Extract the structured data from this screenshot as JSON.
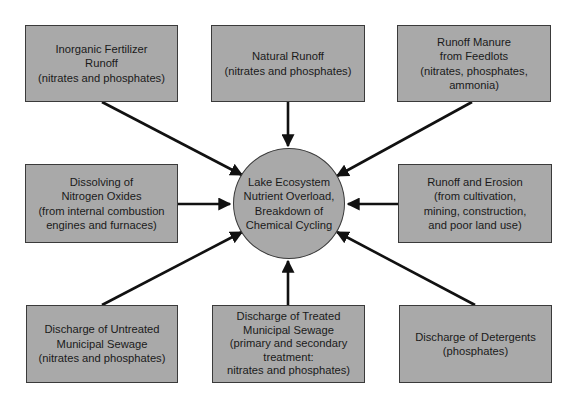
{
  "diagram": {
    "type": "hub-and-spoke",
    "colors": {
      "box_fill": "#a9a9a9",
      "border": "#3a3a3a",
      "arrow": "#111111",
      "background": "#ffffff"
    },
    "center": {
      "label": "Lake Ecosystem\nNutrient Overload,\nBreakdown of\nChemical Cycling"
    },
    "sources": [
      {
        "id": "inorganic-fertilizer",
        "label": "Inorganic Fertilizer\nRunoff\n(nitrates and phosphates)"
      },
      {
        "id": "natural-runoff",
        "label": "Natural Runoff\n(nitrates and phosphates)"
      },
      {
        "id": "manure-feedlots",
        "label": "Runoff Manure\nfrom Feedlots\n(nitrates, phosphates,\nammonia)"
      },
      {
        "id": "nitrogen-oxides",
        "label": "Dissolving of\nNitrogen Oxides\n(from internal combustion\nengines and furnaces)"
      },
      {
        "id": "runoff-erosion",
        "label": "Runoff and Erosion\n(from cultivation,\nmining, construction,\nand poor land use)"
      },
      {
        "id": "untreated-sewage",
        "label": "Discharge of Untreated\nMunicipal Sewage\n(nitrates and phosphates)"
      },
      {
        "id": "treated-sewage",
        "label": "Discharge of Treated\nMunicipal Sewage\n(primary and secondary\ntreatment:\nnitrates and phosphates)"
      },
      {
        "id": "detergents",
        "label": "Discharge of Detergents\n(phosphates)"
      }
    ],
    "edges_direction": "all sources point to center"
  }
}
